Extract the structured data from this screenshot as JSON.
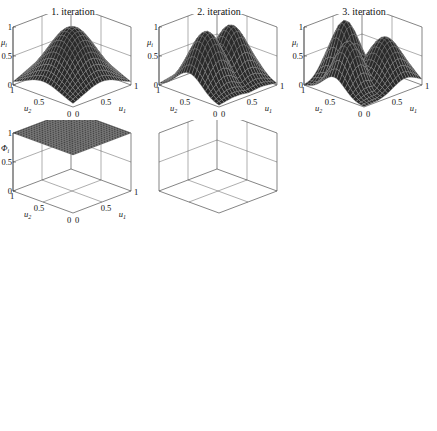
{
  "figure": {
    "columns": [
      {
        "title": "1. iteration"
      },
      {
        "title": "2. iteration"
      },
      {
        "title": "3. iteration"
      }
    ],
    "rows": [
      {
        "zlabel": "μ_i",
        "zlabel_main": "μ",
        "zlabel_sub": "i",
        "zticks": [
          "0",
          "0.5",
          "1"
        ]
      },
      {
        "zlabel": "Φ_i",
        "zlabel_main": "Φ",
        "zlabel_sub": "i",
        "zticks": [
          "0",
          "0.5",
          "1"
        ]
      },
      {
        "zlabel": "ŷ_i",
        "zlabel_main": "ŷ",
        "zlabel_sub": "i",
        "zticks": [
          "0",
          "5"
        ]
      },
      {
        "zlabel": "ŷ",
        "zlabel_main": "ŷ",
        "zlabel_sub": "",
        "zticks": [
          "0",
          "5"
        ]
      }
    ],
    "xaxis": {
      "label": "u_1",
      "label_main": "u",
      "label_sub": "1",
      "ticks": [
        "0",
        "0.5",
        "1"
      ]
    },
    "yaxis": {
      "label": "u_2",
      "label_main": "u",
      "label_sub": "2",
      "ticks": [
        "0",
        "0.5",
        "1"
      ]
    },
    "colors": {
      "surface": "#2a2a2a",
      "mesh": "#9a9a9a",
      "box": "#333333",
      "background": "#ffffff"
    }
  },
  "chart_data": [
    {
      "type": "surface",
      "row": 1,
      "col": 1,
      "title": "1. iteration",
      "zlabel": "μ_i",
      "xlabel": "u_1",
      "ylabel": "u_2",
      "xlim": [
        0,
        1
      ],
      "ylim": [
        0,
        1
      ],
      "zlim": [
        0,
        1
      ],
      "description": "single Gaussian membership peak",
      "peaks": [
        {
          "u1": 0.5,
          "u2": 0.5,
          "height": 1.0,
          "width": 0.3
        }
      ]
    },
    {
      "type": "surface",
      "row": 1,
      "col": 2,
      "title": "2. iteration",
      "zlabel": "μ_i",
      "xlabel": "u_1",
      "ylabel": "u_2",
      "xlim": [
        0,
        1
      ],
      "ylim": [
        0,
        1
      ],
      "zlim": [
        0,
        1
      ],
      "description": "two membership peaks",
      "peaks": [
        {
          "u1": 0.3,
          "u2": 0.5,
          "height": 1.0,
          "width": 0.22
        },
        {
          "u1": 0.72,
          "u2": 0.5,
          "height": 0.95,
          "width": 0.22
        }
      ]
    },
    {
      "type": "surface",
      "row": 1,
      "col": 3,
      "title": "3. iteration",
      "zlabel": "μ_i",
      "xlabel": "u_1",
      "ylabel": "u_2",
      "xlim": [
        0,
        1
      ],
      "ylim": [
        0,
        1
      ],
      "zlim": [
        0,
        1
      ],
      "description": "three membership peaks",
      "peaks": [
        {
          "u1": 0.25,
          "u2": 0.5,
          "height": 0.85,
          "width": 0.18
        },
        {
          "u1": 0.5,
          "u2": 0.8,
          "height": 1.0,
          "width": 0.18
        },
        {
          "u1": 0.72,
          "u2": 0.35,
          "height": 0.8,
          "width": 0.22
        }
      ]
    },
    {
      "type": "surface",
      "row": 2,
      "col": 1,
      "title": "1. iteration",
      "zlabel": "Φ_i",
      "xlabel": "u_1",
      "ylabel": "u_2",
      "xlim": [
        0,
        1
      ],
      "ylim": [
        0,
        1
      ],
      "zlim": [
        0,
        1
      ],
      "description": "validity function constant 1",
      "value": 1.0
    },
    {
      "type": "surface",
      "row": 2,
      "col": 2,
      "title": "2. iteration",
      "zlabel": "Φ_i",
      "xlabel": "u_1",
      "ylabel": "u_2",
      "xlim": [
        0,
        1
      ],
      "ylim": [
        0,
        1
      ],
      "zlim": [
        0,
        1
      ],
      "description": "two validity regions split along u_1 = 0.5 with steep sigmoid transition"
    },
    {
      "type": "surface",
      "row": 2,
      "col": 3,
      "title": "3. iteration",
      "zlabel": "Φ_i",
      "xlabel": "u_1",
      "ylabel": "u_2",
      "xlim": [
        0,
        1
      ],
      "ylim": [
        0,
        1
      ],
      "zlim": [
        0,
        1
      ],
      "description": "three validity regions with central plateau of 1"
    },
    {
      "type": "surface",
      "row": 3,
      "col": 1,
      "title": "1. iteration",
      "zlabel": "ŷ_i",
      "xlabel": "u_1",
      "ylabel": "u_2",
      "xlim": [
        0,
        1
      ],
      "ylim": [
        0,
        1
      ],
      "zlim": [
        0,
        10
      ],
      "description": "single linear local model plane",
      "planes": [
        {
          "z_at_00": 0.5,
          "z_at_10": 3.0,
          "z_at_01": 4.5,
          "z_at_11": 8.0
        }
      ]
    },
    {
      "type": "surface",
      "row": 3,
      "col": 2,
      "title": "2. iteration",
      "zlabel": "ŷ_i",
      "xlabel": "u_1",
      "ylabel": "u_2",
      "xlim": [
        0,
        1
      ],
      "ylim": [
        0,
        1
      ],
      "zlim": [
        0,
        10
      ],
      "description": "two linear local model planes"
    },
    {
      "type": "surface",
      "row": 3,
      "col": 3,
      "title": "3. iteration",
      "zlabel": "ŷ_i",
      "xlabel": "u_1",
      "ylabel": "u_2",
      "xlim": [
        0,
        1
      ],
      "ylim": [
        0,
        1
      ],
      "zlim": [
        0,
        10
      ],
      "description": "three linear local model planes"
    },
    {
      "type": "surface",
      "row": 4,
      "col": 1,
      "title": "1. iteration",
      "zlabel": "ŷ",
      "xlabel": "u_1",
      "ylabel": "u_2",
      "xlim": [
        0,
        1
      ],
      "ylim": [
        0,
        1
      ],
      "zlim": [
        0,
        10
      ],
      "description": "overall model output, linear plane"
    },
    {
      "type": "surface",
      "row": 4,
      "col": 2,
      "title": "2. iteration",
      "zlabel": "ŷ",
      "xlabel": "u_1",
      "ylabel": "u_2",
      "xlim": [
        0,
        1
      ],
      "ylim": [
        0,
        1
      ],
      "zlim": [
        0,
        10
      ],
      "description": "overall model output, piecewise blended"
    },
    {
      "type": "surface",
      "row": 4,
      "col": 3,
      "title": "3. iteration",
      "zlabel": "ŷ",
      "xlabel": "u_1",
      "ylabel": "u_2",
      "xlim": [
        0,
        1
      ],
      "ylim": [
        0,
        1
      ],
      "zlim": [
        0,
        10
      ],
      "description": "overall model output, nonlinear peak at far corner"
    }
  ]
}
